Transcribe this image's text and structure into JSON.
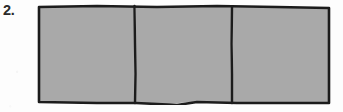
{
  "page": {
    "background_color": "#fdfdfd",
    "width": 343,
    "height": 112
  },
  "exercise": {
    "number_label": "2.",
    "figure_name": "area-model-three-parts"
  },
  "figure": {
    "type": "partitioned-rectangle-area-model",
    "total_parts": 3,
    "shaded_parts": 3,
    "unshaded_parts": 0,
    "fraction_shaded": "3/3",
    "orientation": "horizontal",
    "divider_count": 2,
    "shade_color": "#a9a9a9",
    "outline_color": "#1c1c1c",
    "outline_thickness_px": 2.6,
    "cells": [
      {
        "index": 1,
        "label": "",
        "shaded": true,
        "fill": "#a9a9a9"
      },
      {
        "index": 2,
        "label": "",
        "shaded": true,
        "fill": "#a9a9a9"
      },
      {
        "index": 3,
        "label": "",
        "shaded": true,
        "fill": "#a9a9a9"
      }
    ]
  }
}
